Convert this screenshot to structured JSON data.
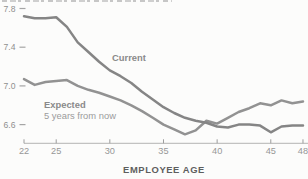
{
  "chart_data": {
    "type": "line",
    "x_label": "EMPLOYEE AGE",
    "x": [
      22,
      23,
      24,
      25,
      26,
      27,
      28,
      29,
      30,
      31,
      32,
      33,
      34,
      35,
      36,
      37,
      38,
      39,
      40,
      41,
      42,
      43,
      44,
      45,
      46,
      47,
      48
    ],
    "series": [
      {
        "name": "Current",
        "label": "Current",
        "color": "#858585",
        "values": [
          7.72,
          7.7,
          7.7,
          7.71,
          7.61,
          7.45,
          7.35,
          7.25,
          7.16,
          7.1,
          7.03,
          6.94,
          6.86,
          6.78,
          6.72,
          6.67,
          6.64,
          6.62,
          6.58,
          6.57,
          6.6,
          6.6,
          6.59,
          6.52,
          6.58,
          6.59,
          6.59
        ]
      },
      {
        "name": "Expected",
        "label": "Expected",
        "sublabel": "5 years from now",
        "color": "#929292",
        "values": [
          7.07,
          7.01,
          7.04,
          7.05,
          7.06,
          7.0,
          6.96,
          6.93,
          6.89,
          6.85,
          6.8,
          6.74,
          6.67,
          6.6,
          6.55,
          6.5,
          6.54,
          6.64,
          6.61,
          6.67,
          6.73,
          6.77,
          6.82,
          6.8,
          6.85,
          6.82,
          6.84
        ]
      }
    ],
    "x_ticks": [
      22,
      25,
      30,
      35,
      40,
      45,
      48
    ],
    "y_ticks": [
      7.8,
      7.4,
      7.0,
      6.6
    ],
    "y_tick_labels": [
      "7.8",
      "7.4",
      "7.0",
      "6.6"
    ],
    "xlim": [
      22,
      48
    ],
    "ylim": [
      6.4,
      7.9
    ],
    "grid": false,
    "legend_position": "inline-annotations",
    "title": ""
  },
  "annotations": {
    "current_label": "Current",
    "expected_label": "Expected",
    "expected_sublabel": "5 years from now"
  },
  "axis": {
    "xlabel": "EMPLOYEE AGE"
  },
  "colors": {
    "current_line": "#858585",
    "expected_line": "#929292",
    "tick_text": "#979797",
    "y_tick_text": "#8f8f8f",
    "annotation_bold": "#8a8a8a",
    "annotation_light": "#9b9b9b",
    "xlabel_text": "#5e5e5e",
    "axis_line": "#b3b3b3",
    "background": "#fcfcfb"
  }
}
